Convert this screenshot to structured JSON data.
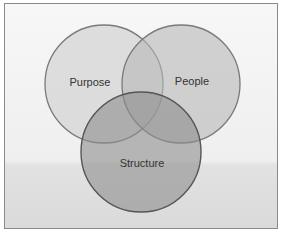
{
  "diagram": {
    "type": "venn",
    "circles": [
      {
        "label": "Purpose",
        "cx": 104,
        "cy": 84,
        "r": 59,
        "fill": "#dcdcdc"
      },
      {
        "label": "People",
        "cx": 181,
        "cy": 84,
        "r": 59,
        "fill": "#c4c4c4"
      },
      {
        "label": "Structure",
        "cx": 141,
        "cy": 152,
        "r": 60,
        "fill": "#9e9e9e"
      }
    ],
    "colors": {
      "stroke": "#6a6a6a",
      "frame": "#8a8a8a"
    }
  }
}
